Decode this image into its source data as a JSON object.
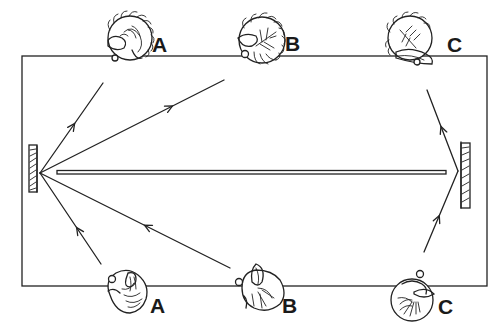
{
  "diagram": {
    "type": "mirror-reflection-illustration",
    "colors": {
      "ink": "#222222",
      "background": "#ffffff"
    },
    "frame": {
      "left": 22,
      "top": 56,
      "right": 487,
      "bottom": 286
    },
    "partition_bar": {
      "x1": 57,
      "x2": 446,
      "y": 172
    },
    "mirrors": [
      {
        "id": "left-mirror",
        "x": 28,
        "y": 145,
        "w": 10,
        "h": 47,
        "reflect_point": [
          40,
          173
        ]
      },
      {
        "id": "right-mirror",
        "x": 460,
        "y": 142,
        "w": 10,
        "h": 66,
        "reflect_point": [
          458,
          171
        ]
      }
    ],
    "top_heads": [
      {
        "label": "A",
        "cx": 130,
        "cy": 38,
        "label_x": 152,
        "label_y": 52
      },
      {
        "label": "B",
        "cx": 262,
        "cy": 40,
        "label_x": 285,
        "label_y": 51
      },
      {
        "label": "C",
        "cx": 410,
        "cy": 38,
        "label_x": 447,
        "label_y": 52
      }
    ],
    "bottom_heads": [
      {
        "label": "A",
        "cx": 128,
        "cy": 297,
        "label_x": 150,
        "label_y": 313
      },
      {
        "label": "B",
        "cx": 258,
        "cy": 292,
        "label_x": 282,
        "label_y": 313
      },
      {
        "label": "C",
        "cx": 412,
        "cy": 300,
        "label_x": 438,
        "label_y": 314
      }
    ],
    "rays": [
      {
        "from": [
          40,
          173
        ],
        "to": [
          103,
          83
        ],
        "arrow_at": 0.55,
        "direction": "to"
      },
      {
        "from": [
          40,
          173
        ],
        "to": [
          224,
          80
        ],
        "arrow_at": 0.72,
        "direction": "to"
      },
      {
        "from": [
          101,
          264
        ],
        "to": [
          40,
          173
        ],
        "arrow_at": 0.4,
        "direction": "to"
      },
      {
        "from": [
          230,
          268
        ],
        "to": [
          40,
          173
        ],
        "arrow_at": 0.45,
        "direction": "to"
      },
      {
        "from": [
          424,
          252
        ],
        "to": [
          458,
          171
        ],
        "arrow_at": 0.45,
        "direction": "to"
      },
      {
        "from": [
          458,
          171
        ],
        "to": [
          427,
          90
        ],
        "arrow_at": 0.55,
        "direction": "to"
      }
    ]
  }
}
